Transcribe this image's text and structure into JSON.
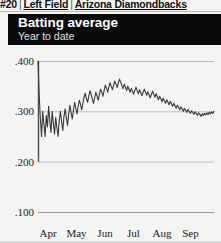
{
  "breadcrumb": {
    "rank": "#20",
    "separator": "|",
    "position": "Left Field",
    "team": "Arizona Diamondbacks"
  },
  "header": {
    "title": "Batting average",
    "subtitle": "Year to date",
    "background_color": "#0a0a0a",
    "title_color": "#ffffff"
  },
  "chart_data": {
    "type": "line",
    "title": "Batting average",
    "subtitle": "Year to date",
    "xlabel": "",
    "ylabel": "",
    "grid": true,
    "legend": false,
    "line_color": "#3a3a3a",
    "background_color": "#f4f4f2",
    "ylim": [
      0.1,
      0.4
    ],
    "yticks": [
      0.4,
      0.3,
      0.2,
      0.1
    ],
    "ytick_labels": [
      ".400",
      ".300",
      ".200",
      ".100"
    ],
    "xticks": [
      "Apr",
      "May",
      "Jun",
      "Jul",
      "Aug",
      "Sep"
    ],
    "xtick_labels": [
      "Apr",
      "May",
      "Jun",
      "Jul",
      "Aug",
      "Sep"
    ],
    "series": [
      {
        "name": "Batting average",
        "values": [
          0.4,
          0.333,
          0.286,
          0.25,
          0.3,
          0.273,
          0.25,
          0.292,
          0.269,
          0.31,
          0.281,
          0.258,
          0.3,
          0.276,
          0.255,
          0.288,
          0.268,
          0.25,
          0.282,
          0.3,
          0.279,
          0.262,
          0.29,
          0.305,
          0.288,
          0.272,
          0.295,
          0.312,
          0.298,
          0.285,
          0.302,
          0.318,
          0.306,
          0.295,
          0.31,
          0.322,
          0.314,
          0.303,
          0.316,
          0.328,
          0.336,
          0.325,
          0.318,
          0.33,
          0.341,
          0.333,
          0.324,
          0.316,
          0.327,
          0.338,
          0.33,
          0.322,
          0.334,
          0.344,
          0.338,
          0.33,
          0.341,
          0.352,
          0.346,
          0.338,
          0.348,
          0.357,
          0.35,
          0.343,
          0.352,
          0.36,
          0.354,
          0.347,
          0.356,
          0.364,
          0.358,
          0.351,
          0.345,
          0.354,
          0.348,
          0.341,
          0.35,
          0.344,
          0.338,
          0.346,
          0.34,
          0.334,
          0.342,
          0.348,
          0.341,
          0.335,
          0.343,
          0.337,
          0.331,
          0.338,
          0.344,
          0.338,
          0.332,
          0.339,
          0.333,
          0.327,
          0.334,
          0.34,
          0.334,
          0.328,
          0.335,
          0.329,
          0.323,
          0.33,
          0.325,
          0.319,
          0.326,
          0.321,
          0.316,
          0.323,
          0.318,
          0.313,
          0.32,
          0.315,
          0.31,
          0.316,
          0.311,
          0.306,
          0.312,
          0.308,
          0.303,
          0.309,
          0.305,
          0.3,
          0.306,
          0.302,
          0.298,
          0.304,
          0.3,
          0.296,
          0.301,
          0.298,
          0.294,
          0.299,
          0.296,
          0.292,
          0.297,
          0.294,
          0.29,
          0.295,
          0.292,
          0.296,
          0.293,
          0.297,
          0.294,
          0.298,
          0.295,
          0.299,
          0.296,
          0.3
        ]
      }
    ],
    "axis_line_color": "#4a4a4a",
    "gridline_color": "#b5b5b3"
  }
}
